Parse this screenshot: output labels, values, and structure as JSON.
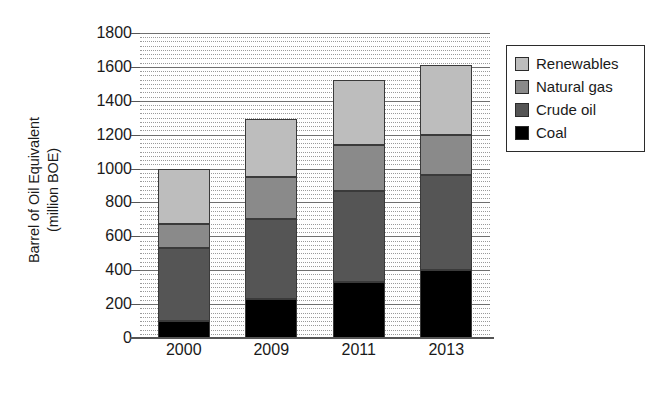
{
  "chart_data": {
    "type": "bar",
    "stacked": true,
    "title": "",
    "xlabel": "",
    "ylabel": "Barrel of Oil Equivalent (million BOE)",
    "ylabel_line1": "Barrel of Oil Equivalent",
    "ylabel_line2": "(million BOE)",
    "categories": [
      "2000",
      "2009",
      "2011",
      "2013"
    ],
    "ylim": [
      0,
      1800
    ],
    "yticks": [
      0,
      200,
      400,
      600,
      800,
      1000,
      1200,
      1400,
      1600,
      1800
    ],
    "ytick_labels": [
      "0",
      "200",
      "400",
      "600",
      "800",
      "1000",
      "1200",
      "1400",
      "1600",
      "1800"
    ],
    "grid": true,
    "grid_major_step": 200,
    "grid_minor_step": 25,
    "legend_position": "right",
    "series": [
      {
        "name": "Coal",
        "color": "#000000",
        "values": [
          100,
          230,
          330,
          400
        ]
      },
      {
        "name": "Crude oil",
        "color": "#555555",
        "values": [
          430,
          470,
          540,
          560
        ]
      },
      {
        "name": "Natural gas",
        "color": "#8a8a8a",
        "values": [
          140,
          250,
          270,
          240
        ]
      },
      {
        "name": "Renewables",
        "color": "#bdbdbd",
        "values": [
          330,
          340,
          380,
          410
        ]
      }
    ],
    "stack_order_bottom_to_top": [
      "Coal",
      "Crude oil",
      "Natural gas",
      "Renewables"
    ],
    "cumulative_tops": {
      "2000": {
        "Coal": 100,
        "Crude oil": 530,
        "Natural gas": 670,
        "Renewables": 1000
      },
      "2009": {
        "Coal": 230,
        "Crude oil": 700,
        "Natural gas": 950,
        "Renewables": 1290
      },
      "2011": {
        "Coal": 330,
        "Crude oil": 870,
        "Natural gas": 1140,
        "Renewables": 1520
      },
      "2013": {
        "Coal": 400,
        "Crude oil": 960,
        "Natural gas": 1200,
        "Renewables": 1610
      }
    },
    "totals": [
      1000,
      1290,
      1520,
      1610
    ]
  },
  "legend": {
    "entries": [
      {
        "label": "Renewables",
        "color": "#bdbdbd"
      },
      {
        "label": "Natural gas",
        "color": "#8a8a8a"
      },
      {
        "label": "Crude oil",
        "color": "#555555"
      },
      {
        "label": "Coal",
        "color": "#000000"
      }
    ]
  }
}
